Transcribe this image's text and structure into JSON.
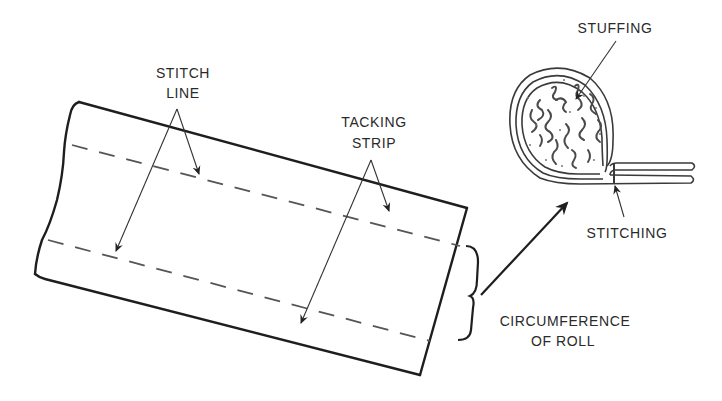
{
  "diagram": {
    "labels": {
      "stitch_line_1": "STITCH",
      "stitch_line_2": "LINE",
      "tacking_strip_1": "TACKING",
      "tacking_strip_2": "STRIP",
      "stuffing": "STUFFING",
      "stitching": "STITCHING",
      "circumference_1": "CIRCUMFERENCE",
      "circumference_2": "OF ROLL"
    },
    "parts": [
      {
        "name": "fabric-strip",
        "description": "flat strip of material, slightly rotated"
      },
      {
        "name": "stitch-lines",
        "count": 2,
        "style": "dashed"
      },
      {
        "name": "roll-cross-section",
        "contents": "stuffing"
      },
      {
        "name": "brace",
        "meaning": "circumference of roll"
      }
    ],
    "colors": {
      "line": "#1e1e1e",
      "dash": "#555555",
      "text": "#2a2a2a",
      "background": "#ffffff"
    }
  }
}
